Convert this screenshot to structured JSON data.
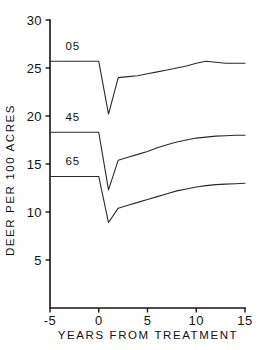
{
  "chart_data": {
    "type": "line",
    "title": "",
    "xlabel": "YEARS FROM TREATMENT",
    "ylabel": "DEER PER 100 ACRES",
    "xlim": [
      -5,
      15
    ],
    "ylim": [
      0,
      30
    ],
    "grid": false,
    "legend_position": "inline-left",
    "xticks": [
      -5,
      0,
      5,
      10,
      15
    ],
    "xticklabels": [
      "-5",
      "0",
      "5",
      "10",
      "15"
    ],
    "yticks": [
      5,
      10,
      15,
      20,
      25,
      30
    ],
    "yticklabels": [
      "5",
      "10",
      "15",
      "20",
      "25",
      "30"
    ],
    "series": [
      {
        "name": "05",
        "label": "05",
        "label_x": -3.4,
        "label_y": 26.9,
        "x": [
          -5,
          0,
          1,
          2,
          3,
          4,
          5,
          6,
          7,
          8,
          9,
          10,
          11,
          12,
          13,
          14,
          15
        ],
        "y": [
          25.7,
          25.7,
          20.2,
          24.0,
          24.1,
          24.2,
          24.4,
          24.6,
          24.8,
          25.0,
          25.2,
          25.5,
          25.7,
          25.6,
          25.5,
          25.5,
          25.5
        ]
      },
      {
        "name": "45",
        "label": "45",
        "label_x": -3.4,
        "label_y": 19.5,
        "x": [
          -5,
          0,
          1,
          2,
          3,
          4,
          5,
          6,
          7,
          8,
          9,
          10,
          11,
          12,
          13,
          14,
          15
        ],
        "y": [
          18.3,
          18.3,
          12.3,
          15.4,
          15.7,
          16.0,
          16.3,
          16.7,
          17.0,
          17.3,
          17.5,
          17.7,
          17.8,
          17.9,
          17.95,
          18.0,
          18.0
        ]
      },
      {
        "name": "65",
        "label": "65",
        "label_x": -3.4,
        "label_y": 14.9,
        "x": [
          -5,
          0,
          1,
          2,
          3,
          4,
          5,
          6,
          7,
          8,
          9,
          10,
          11,
          12,
          13,
          14,
          15
        ],
        "y": [
          13.7,
          13.7,
          8.9,
          10.4,
          10.7,
          11.0,
          11.3,
          11.6,
          11.9,
          12.2,
          12.4,
          12.6,
          12.75,
          12.85,
          12.9,
          12.95,
          13.0
        ]
      }
    ],
    "colors": {
      "line": "#2a2a2a",
      "axis": "#151515",
      "text": "#111111",
      "background": "#ffffff"
    }
  }
}
